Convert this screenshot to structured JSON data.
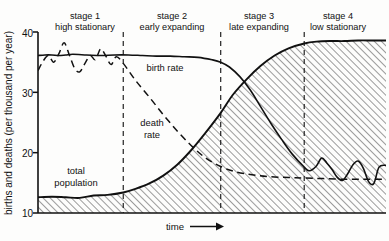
{
  "chart_data": {
    "type": "line",
    "title": "",
    "xlabel": "time",
    "ylabel": "births and deaths (per thousand per year)",
    "xlim": [
      0,
      100
    ],
    "ylim": [
      10,
      40
    ],
    "grid": false,
    "legend": "inline-annotations",
    "yticks": [
      "10",
      "20",
      "30",
      "40"
    ],
    "ytick_values": [
      10,
      20,
      30,
      40
    ],
    "xticks": [],
    "stages": [
      {
        "id": "stage1",
        "title": "stage 1",
        "subtitle": "high stationary",
        "x_start": 0,
        "x_end": 24.5
      },
      {
        "id": "stage2",
        "title": "stage 2",
        "subtitle": "early expanding",
        "x_start": 24.5,
        "x_end": 52.5
      },
      {
        "id": "stage3",
        "title": "stage 3",
        "subtitle": "late expanding",
        "x_start": 52.5,
        "x_end": 76.5
      },
      {
        "id": "stage4",
        "title": "stage 4",
        "subtitle": "low stationary",
        "x_start": 76.5,
        "x_end": 100
      }
    ],
    "stage_dividers": [
      24.5,
      52.5,
      76.5
    ],
    "series": [
      {
        "name": "birth rate",
        "style": "solid",
        "label": "birth rate",
        "x": [
          0,
          2,
          4,
          6,
          8,
          10,
          14,
          18,
          22,
          26,
          30,
          34,
          38,
          42,
          46,
          50,
          52.5,
          55,
          58,
          61,
          64,
          67,
          70,
          73,
          76.5,
          78,
          80,
          81.5,
          83,
          84.5,
          86,
          87.5,
          89,
          90.5,
          92,
          93.5,
          95,
          96.5,
          98,
          100
        ],
        "y": [
          36.1,
          36.2,
          36.2,
          36.1,
          36.2,
          36.3,
          36.2,
          36.1,
          36.2,
          36.2,
          36.1,
          36.0,
          36.0,
          35.9,
          35.8,
          35.4,
          35.0,
          34.2,
          32.6,
          30.4,
          27.6,
          24.8,
          22.2,
          19.8,
          17.6,
          17.0,
          17.8,
          19.1,
          18.3,
          17.2,
          15.9,
          15.4,
          16.5,
          18.0,
          18.6,
          17.4,
          15.2,
          14.9,
          17.6,
          17.9
        ]
      },
      {
        "name": "death rate",
        "style": "dashed",
        "label": "death rate",
        "x": [
          0,
          1.5,
          3,
          4.5,
          6,
          7.5,
          9,
          10.5,
          12,
          13.5,
          15,
          16.5,
          18,
          19.5,
          21,
          22.5,
          24.5,
          28,
          32,
          36,
          40,
          44,
          48,
          52.5,
          57,
          62,
          67,
          72,
          76.5,
          82,
          88,
          94,
          100
        ],
        "y": [
          33.6,
          35.2,
          36.1,
          35.0,
          36.4,
          38.2,
          36.2,
          34.0,
          33.4,
          34.8,
          36.1,
          35.4,
          37.2,
          36.0,
          34.6,
          35.9,
          34.8,
          32.0,
          29.2,
          26.3,
          23.6,
          21.2,
          19.2,
          17.7,
          16.8,
          16.3,
          16.0,
          15.9,
          15.8,
          15.7,
          15.6,
          15.6,
          15.6
        ]
      },
      {
        "name": "total population",
        "style": "solid-filled",
        "label": "total population",
        "fill": "hatched",
        "x": [
          0,
          4,
          8,
          12,
          16,
          20,
          24.5,
          28,
          32,
          36,
          40,
          44,
          48,
          52.5,
          56,
          60,
          64,
          68,
          72,
          76.5,
          80,
          84,
          88,
          92,
          96,
          100
        ],
        "y": [
          12.6,
          12.7,
          12.6,
          12.5,
          12.9,
          13.0,
          13.4,
          14.0,
          14.9,
          16.2,
          18.0,
          20.4,
          23.2,
          26.6,
          29.6,
          32.2,
          34.4,
          36.1,
          37.3,
          38.1,
          38.4,
          38.5,
          38.5,
          38.6,
          38.6,
          38.6
        ]
      }
    ]
  },
  "axis": {
    "y_title": "births and deaths (per thousand per year)",
    "x_title": "time",
    "x_arrow": "→"
  },
  "colors": {
    "line": "#111111",
    "hatch": "#555555",
    "background": "#fdfdfc",
    "axis": "#111111"
  }
}
